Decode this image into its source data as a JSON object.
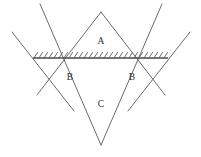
{
  "figure": {
    "type": "slip-line-field-diagram",
    "title": "",
    "background_color": "#ffffff",
    "line_color": "#6b6b6b",
    "ground_line_color": "#5a5a5a",
    "label_color": "#2b2b2b",
    "canvas": {
      "width": 201,
      "height": 157
    },
    "regions": [
      {
        "id": "A",
        "label": "A",
        "x": 101,
        "y": 42
      },
      {
        "id": "B-left",
        "label": "B",
        "x": 70,
        "y": 78
      },
      {
        "id": "B-right",
        "label": "B",
        "x": 132,
        "y": 78
      },
      {
        "id": "C",
        "label": "C",
        "x": 101,
        "y": 105
      }
    ],
    "vertices": {
      "top": {
        "x": 101,
        "y": 12
      },
      "left": {
        "x": 47,
        "y": 78
      },
      "right": {
        "x": 155,
        "y": 78
      },
      "bottom": {
        "x": 101,
        "y": 145
      },
      "mid_upper_left": {
        "x": 74,
        "y": 45
      },
      "mid_upper_right": {
        "x": 128,
        "y": 45
      },
      "mid_lower_left": {
        "x": 74,
        "y": 111
      },
      "mid_lower_right": {
        "x": 128,
        "y": 111
      },
      "center": {
        "x": 101,
        "y": 78
      }
    },
    "ground_line": {
      "y": 58,
      "x_start": 33,
      "x_end": 168,
      "hatching": "above",
      "hatch_count": 27,
      "hatch_angle_deg": 55
    },
    "extended_rays": {
      "left_ray_start": {
        "x": 12,
        "y": 32
      },
      "right_ray_start": {
        "x": 190,
        "y": 32
      },
      "left_ray_end": {
        "x": 74,
        "y": 111
      },
      "right_ray_end": {
        "x": 128,
        "y": 111
      }
    }
  }
}
